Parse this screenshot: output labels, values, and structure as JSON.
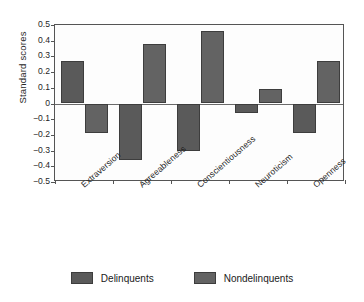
{
  "chart_data": {
    "type": "bar",
    "title": "",
    "xlabel": "",
    "ylabel": "Standard scores",
    "ylim": [
      -0.5,
      0.5
    ],
    "ytick_step": 0.1,
    "grid": false,
    "legend_position": "bottom",
    "categories": [
      "Extraversion",
      "Agreeableness",
      "Conscientiousness",
      "Neuroticism",
      "Openness"
    ],
    "series": [
      {
        "name": "Delinquents",
        "color": "#5a5a5a",
        "values": [
          0.27,
          -0.36,
          -0.3,
          -0.06,
          -0.19
        ]
      },
      {
        "name": "Nondelinquents",
        "color": "#636363",
        "values": [
          -0.19,
          0.38,
          0.46,
          0.09,
          0.27
        ]
      }
    ],
    "ytick_labels": [
      "0.5",
      "0.4",
      "0.3",
      "0.2",
      "0.1",
      "0",
      "−0.1",
      "−0.2",
      "−0.3",
      "−0.4",
      "−0.5"
    ],
    "ytick_values": [
      0.5,
      0.4,
      0.3,
      0.2,
      0.1,
      0,
      -0.1,
      -0.2,
      -0.3,
      -0.4,
      -0.5
    ]
  },
  "legend": {
    "items": [
      {
        "label": "Delinquents",
        "color": "#5a5a5a"
      },
      {
        "label": "Nondelinquents",
        "color": "#636363"
      }
    ]
  }
}
